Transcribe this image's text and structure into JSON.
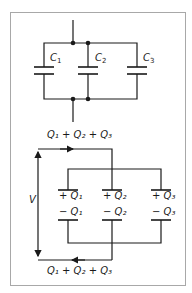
{
  "diagram": {
    "top_circuit": {
      "capacitors": [
        {
          "label": "C",
          "subscript": "1"
        },
        {
          "label": "C",
          "subscript": "2"
        },
        {
          "label": "C",
          "subscript": "3"
        }
      ],
      "total_charge_label": "Q₁ + Q₂ + Q₃"
    },
    "bottom_circuit": {
      "top_charge_label": "Q₁ + Q₂ + Q₃",
      "bottom_charge_label": "Q₁ + Q₂ + Q₃",
      "voltage_label": "V",
      "plates": [
        {
          "plus": "+ Q₁",
          "minus": "− Q₁"
        },
        {
          "plus": "+ Q₂",
          "minus": "− Q₂"
        },
        {
          "plus": "+ Q₃",
          "minus": "− Q₃"
        }
      ]
    },
    "colors": {
      "line": "#1a1a1a",
      "frame": "#a8a8a8"
    }
  }
}
